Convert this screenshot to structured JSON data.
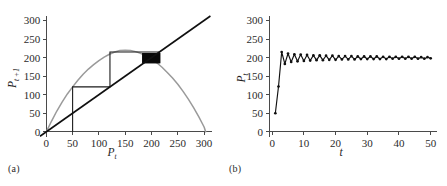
{
  "figure": {
    "panels": [
      {
        "id": "a",
        "label": "(a)",
        "type": "cobweb"
      },
      {
        "id": "b",
        "label": "(b)",
        "type": "timeseries"
      }
    ]
  },
  "chart_data": [
    {
      "type": "line",
      "panel": "a",
      "title": "",
      "xlabel": "P",
      "xlabel_sub": "t",
      "ylabel": "P",
      "ylabel_sub": "t +1",
      "xlim": [
        -12,
        315
      ],
      "ylim": [
        -14,
        312
      ],
      "xticks": [
        0,
        50,
        100,
        150,
        200,
        250,
        300
      ],
      "yticks": [
        0,
        50,
        100,
        150,
        200,
        250,
        300
      ],
      "grid": false,
      "legend": "none",
      "series": [
        {
          "name": "recruitment curve",
          "color": "#9a9a9a",
          "note": "hump-shaped map, peak near P_t = 150, P_t+1 = 220, returns to 0 near P_t = 303",
          "x": [
            0,
            10,
            20,
            30,
            40,
            50,
            60,
            70,
            80,
            90,
            100,
            110,
            120,
            130,
            140,
            150,
            160,
            170,
            180,
            190,
            200,
            210,
            220,
            230,
            240,
            250,
            260,
            270,
            280,
            290,
            300,
            303
          ],
          "y": [
            0,
            29,
            56,
            80,
            102,
            121,
            139,
            155,
            169,
            181,
            192,
            201,
            209,
            215,
            219,
            220,
            219,
            216,
            211,
            205,
            196,
            186,
            174,
            160,
            145,
            128,
            109,
            88,
            65,
            40,
            13,
            0
          ]
        },
        {
          "name": "identity line",
          "color": "#101010",
          "note": "P_t+1 = P_t diagonal",
          "x": [
            -12,
            312
          ],
          "y": [
            -12,
            312
          ]
        },
        {
          "name": "cobweb trajectory",
          "color": "#1b1b1b",
          "note": "staircase from initial P = 50 converging on fixed point near 200",
          "points": [
            [
              50,
              0
            ],
            [
              50,
              121
            ],
            [
              121,
              121
            ],
            [
              121,
              215
            ],
            [
              215,
              215
            ],
            [
              215,
              186
            ],
            [
              186,
              186
            ],
            [
              186,
              207
            ],
            [
              207,
              207
            ],
            [
              207,
              193
            ],
            [
              193,
              193
            ],
            [
              193,
              203
            ],
            [
              203,
              203
            ],
            [
              203,
              196
            ],
            [
              196,
              196
            ],
            [
              196,
              201
            ],
            [
              201,
              201
            ],
            [
              201,
              198
            ],
            [
              198,
              198
            ],
            [
              198,
              200
            ],
            [
              200,
              200
            ]
          ]
        }
      ],
      "annotations": [
        {
          "name": "dense-cobweb-block",
          "note": "solid black region where cobweb lines overlap at the fixed point",
          "x_range": [
            183,
            216
          ],
          "y_range": [
            186,
            211
          ]
        }
      ]
    },
    {
      "type": "line",
      "panel": "b",
      "title": "",
      "xlabel": "t",
      "ylabel": "P",
      "ylabel_sub": "t",
      "xlim": [
        -1,
        52
      ],
      "ylim": [
        -14,
        312
      ],
      "xticks": [
        0,
        10,
        20,
        30,
        40,
        50
      ],
      "yticks": [
        0,
        50,
        100,
        150,
        200,
        250,
        300
      ],
      "grid": false,
      "legend": "none",
      "markers": "filled-circle",
      "series": [
        {
          "name": "population trajectory",
          "color": "#101010",
          "note": "starts at 50, overshoots to 215, then damped period-2 oscillation settling near 200",
          "t": [
            1,
            2,
            3,
            4,
            5,
            6,
            7,
            8,
            9,
            10,
            11,
            12,
            13,
            14,
            15,
            16,
            17,
            18,
            19,
            20,
            21,
            22,
            23,
            24,
            25,
            26,
            27,
            28,
            29,
            30,
            31,
            32,
            33,
            34,
            35,
            36,
            37,
            38,
            39,
            40,
            41,
            42,
            43,
            44,
            45,
            46,
            47,
            48,
            49,
            50
          ],
          "values": [
            50,
            122,
            215,
            183,
            211,
            188,
            209,
            190,
            208,
            191,
            207,
            192,
            206,
            193,
            206,
            193,
            205,
            194,
            205,
            194,
            204,
            195,
            204,
            195,
            204,
            195,
            203,
            196,
            203,
            196,
            203,
            196,
            203,
            196,
            202,
            196,
            202,
            197,
            202,
            197,
            202,
            197,
            202,
            197,
            202,
            197,
            201,
            197,
            201,
            198
          ]
        }
      ]
    }
  ]
}
